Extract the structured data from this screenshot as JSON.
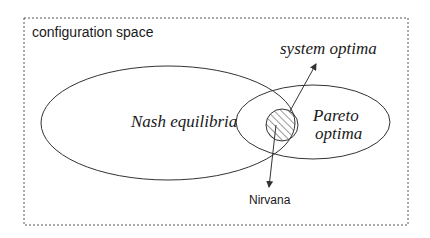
{
  "diagram": {
    "container_label": "configuration space",
    "sets": [
      {
        "id": "nash",
        "label": "Nash equilibria"
      },
      {
        "id": "pareto",
        "label_line1": "Pareto",
        "label_line2": "optima"
      },
      {
        "id": "system",
        "label": "system optima"
      }
    ],
    "intersection_label": "Nirvana",
    "colors": {
      "stroke": "#333333",
      "text": "#1a1a1a",
      "background": "#ffffff"
    }
  }
}
